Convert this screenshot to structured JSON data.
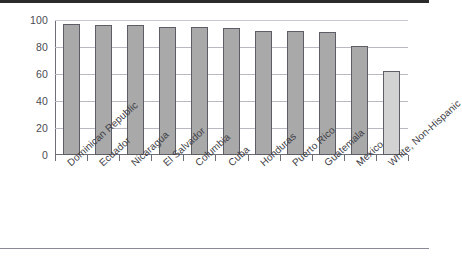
{
  "chart_data": {
    "type": "bar",
    "title": "",
    "subtitle": "",
    "xlabel": "",
    "ylabel": "",
    "ylim": [
      0,
      100
    ],
    "ytick_step": 20,
    "ytick_labels": [
      "100",
      "80",
      "60",
      "40",
      "20",
      "0"
    ],
    "grid": true,
    "legend": "none",
    "categories": [
      "Dominican Republic",
      "Ecuador",
      "Nicaragua",
      "El Salvador",
      "Columbia",
      "Cuba",
      "Honduras",
      "Puerto Rico",
      "Guatemala",
      "Mexico",
      "White, Non-Hispanic"
    ],
    "values": [
      97,
      96,
      96,
      95,
      95,
      94,
      92,
      92,
      91,
      81,
      62
    ],
    "bar_colors": [
      "#a9a9a9",
      "#a9a9a9",
      "#a9a9a9",
      "#a9a9a9",
      "#a9a9a9",
      "#a9a9a9",
      "#a9a9a9",
      "#a9a9a9",
      "#a9a9a9",
      "#a9a9a9",
      "#d2d2d2"
    ],
    "bar_edge_color": "#5d5d66",
    "highlight_category": "White, Non-Hispanic",
    "axis_color": "#6e6e78",
    "grid_color": "#b9b9c2",
    "background_color": "#ffffff"
  }
}
